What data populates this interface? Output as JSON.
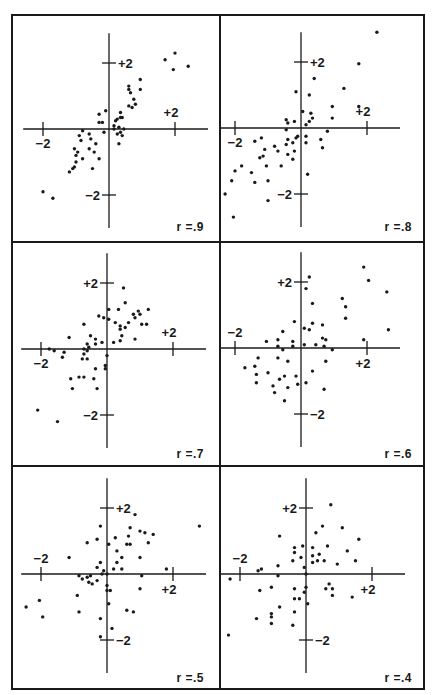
{
  "chart_data": [
    {
      "type": "scatter",
      "title": "r = .9",
      "label": "r =.9",
      "xlim": [
        -2.9,
        3.3
      ],
      "ylim": [
        -3.3,
        3.4
      ],
      "xticks": [
        -2,
        2
      ],
      "yticks": [
        -2,
        2
      ],
      "tick_labels": {
        "x_neg": "−2",
        "x_pos": "+2",
        "y_pos": "+2",
        "y_neg": "−2"
      },
      "points": [
        [
          -2.0,
          -1.9
        ],
        [
          -1.7,
          -2.1
        ],
        [
          -1.1,
          -1.2
        ],
        [
          -1.2,
          -1.3
        ],
        [
          -1.0,
          -1.0
        ],
        [
          -1.05,
          -1.15
        ],
        [
          -0.8,
          -0.9
        ],
        [
          -0.5,
          -1.2
        ],
        [
          -0.3,
          -0.9
        ],
        [
          -1.05,
          -0.6
        ],
        [
          -0.95,
          -0.7
        ],
        [
          -0.6,
          -0.6
        ],
        [
          -0.9,
          -0.2
        ],
        [
          -1.0,
          -0.8
        ],
        [
          -0.85,
          -0.35
        ],
        [
          -0.55,
          -0.3
        ],
        [
          -0.45,
          -0.7
        ],
        [
          -0.8,
          -0.05
        ],
        [
          -0.6,
          -0.15
        ],
        [
          -0.4,
          -0.45
        ],
        [
          -0.15,
          -0.1
        ],
        [
          -0.3,
          0.2
        ],
        [
          -0.2,
          0.2
        ],
        [
          -0.3,
          0.45
        ],
        [
          -0.1,
          0.55
        ],
        [
          0.15,
          0.1
        ],
        [
          0.2,
          0.25
        ],
        [
          0.25,
          0.3
        ],
        [
          0.35,
          0.35
        ],
        [
          0.4,
          0.35
        ],
        [
          0.35,
          0.5
        ],
        [
          0.15,
          0.0
        ],
        [
          0.3,
          0.05
        ],
        [
          0.35,
          -0.1
        ],
        [
          0.25,
          -0.15
        ],
        [
          0.4,
          -0.2
        ],
        [
          0.3,
          -0.45
        ],
        [
          0.45,
          0.0
        ],
        [
          0.6,
          0.7
        ],
        [
          0.7,
          0.65
        ],
        [
          0.8,
          0.75
        ],
        [
          0.65,
          1.1
        ],
        [
          0.75,
          0.9
        ],
        [
          0.6,
          1.2
        ],
        [
          0.6,
          1.3
        ],
        [
          0.95,
          1.2
        ],
        [
          0.95,
          1.5
        ],
        [
          1.7,
          2.1
        ],
        [
          2.0,
          2.3
        ],
        [
          1.95,
          1.8
        ],
        [
          2.4,
          1.9
        ]
      ]
    },
    {
      "type": "scatter",
      "title": "r = .8",
      "label": "r =.8",
      "xlim": [
        -2.9,
        3.3
      ],
      "ylim": [
        -3.3,
        3.4
      ],
      "xticks": [
        -2,
        2
      ],
      "yticks": [
        -2,
        2
      ],
      "tick_labels": {
        "x_neg": "−2",
        "x_pos": "+2",
        "y_pos": "+2",
        "y_neg": "−2"
      },
      "points": [
        [
          -2.3,
          -2.0
        ],
        [
          -2.05,
          -2.7
        ],
        [
          -2.1,
          -1.6
        ],
        [
          -2.0,
          -1.3
        ],
        [
          -1.8,
          -1.15
        ],
        [
          -1.5,
          -1.35
        ],
        [
          -1.4,
          -1.65
        ],
        [
          -1.4,
          -0.4
        ],
        [
          -1.2,
          -0.3
        ],
        [
          -1.25,
          -0.9
        ],
        [
          -1.15,
          -0.85
        ],
        [
          -1.1,
          -0.65
        ],
        [
          -1.05,
          -1.15
        ],
        [
          -1.0,
          -1.6
        ],
        [
          -1.0,
          -2.2
        ],
        [
          -0.8,
          -0.55
        ],
        [
          -0.7,
          -0.7
        ],
        [
          -0.6,
          -1.15
        ],
        [
          -0.45,
          -0.5
        ],
        [
          -0.4,
          -0.8
        ],
        [
          -0.4,
          -0.35
        ],
        [
          -0.45,
          0.25
        ],
        [
          -0.4,
          0.15
        ],
        [
          -0.45,
          -0.05
        ],
        [
          -0.25,
          -0.45
        ],
        [
          -0.25,
          -0.95
        ],
        [
          -0.2,
          -0.7
        ],
        [
          -0.2,
          0.2
        ],
        [
          -0.15,
          -0.3
        ],
        [
          -0.1,
          -0.25
        ],
        [
          -0.15,
          1.1
        ],
        [
          0.05,
          0.5
        ],
        [
          0.15,
          -0.25
        ],
        [
          0.15,
          -0.45
        ],
        [
          0.15,
          0.1
        ],
        [
          0.25,
          0.2
        ],
        [
          0.3,
          0.45
        ],
        [
          0.35,
          0.3
        ],
        [
          0.25,
          1.0
        ],
        [
          0.4,
          1.5
        ],
        [
          0.2,
          -1.4
        ],
        [
          0.6,
          -0.35
        ],
        [
          0.65,
          -0.6
        ],
        [
          0.8,
          -0.1
        ],
        [
          0.95,
          0.3
        ],
        [
          0.95,
          0.65
        ],
        [
          1.3,
          1.2
        ],
        [
          1.75,
          1.95
        ],
        [
          1.75,
          0.65
        ],
        [
          2.3,
          2.9
        ]
      ]
    },
    {
      "type": "scatter",
      "title": "r = .7",
      "label": "r =.7",
      "xlim": [
        -2.9,
        3.3
      ],
      "ylim": [
        -3.3,
        3.4
      ],
      "xticks": [
        -2,
        2
      ],
      "yticks": [
        -2,
        2
      ],
      "tick_labels": {
        "x_neg": "−2",
        "x_pos": "+2",
        "y_pos": "+2",
        "y_neg": "−2"
      },
      "points": [
        [
          -2.1,
          -1.85
        ],
        [
          -1.5,
          -2.2
        ],
        [
          -1.05,
          -1.2
        ],
        [
          -1.1,
          -0.9
        ],
        [
          -0.85,
          -0.85
        ],
        [
          -0.7,
          -0.85
        ],
        [
          -0.4,
          -0.9
        ],
        [
          -0.3,
          -1.2
        ],
        [
          -0.35,
          -0.6
        ],
        [
          -0.05,
          -0.5
        ],
        [
          -0.05,
          -0.6
        ],
        [
          0.0,
          -0.2
        ],
        [
          -0.6,
          -0.3
        ],
        [
          -0.75,
          -0.3
        ],
        [
          -0.7,
          -0.15
        ],
        [
          -0.6,
          -0.05
        ],
        [
          -0.55,
          0.05
        ],
        [
          -0.6,
          0.15
        ],
        [
          -0.7,
          0.0
        ],
        [
          -1.6,
          -0.05
        ],
        [
          -1.75,
          0.0
        ],
        [
          -1.35,
          -0.25
        ],
        [
          -1.3,
          -0.1
        ],
        [
          -1.15,
          0.35
        ],
        [
          -0.5,
          0.4
        ],
        [
          -0.35,
          0.3
        ],
        [
          -0.35,
          0.15
        ],
        [
          -0.15,
          0.2
        ],
        [
          0.2,
          0.2
        ],
        [
          -0.7,
          0.75
        ],
        [
          -0.25,
          1.0
        ],
        [
          -0.1,
          0.95
        ],
        [
          0.05,
          0.9
        ],
        [
          0.05,
          1.2
        ],
        [
          0.25,
          0.8
        ],
        [
          0.4,
          0.6
        ],
        [
          0.4,
          0.7
        ],
        [
          0.4,
          0.25
        ],
        [
          0.45,
          0.4
        ],
        [
          0.55,
          0.65
        ],
        [
          0.65,
          0.8
        ],
        [
          0.35,
          1.2
        ],
        [
          0.55,
          1.4
        ],
        [
          0.5,
          1.85
        ],
        [
          0.85,
          0.3
        ],
        [
          0.8,
          1.05
        ],
        [
          0.85,
          0.95
        ],
        [
          0.95,
          1.15
        ],
        [
          1.05,
          0.75
        ],
        [
          1.0,
          1.05
        ],
        [
          1.2,
          0.75
        ],
        [
          1.25,
          1.2
        ]
      ]
    },
    {
      "type": "scatter",
      "title": "r = .6",
      "label": "r =.6",
      "xlim": [
        -2.9,
        3.3
      ],
      "ylim": [
        -3.3,
        3.4
      ],
      "xticks": [
        -2,
        2
      ],
      "yticks": [
        -2,
        2
      ],
      "tick_labels": {
        "x_neg": "−2",
        "x_pos": "+2",
        "y_pos": "+2",
        "y_neg": "−2"
      },
      "points": [
        [
          -1.7,
          -0.6
        ],
        [
          -1.4,
          -0.55
        ],
        [
          -1.35,
          -0.8
        ],
        [
          -1.35,
          -1.05
        ],
        [
          -1.3,
          -0.3
        ],
        [
          -1.0,
          -0.75
        ],
        [
          -0.85,
          -1.15
        ],
        [
          -0.8,
          -1.35
        ],
        [
          -0.7,
          -0.3
        ],
        [
          -0.65,
          -0.95
        ],
        [
          -0.5,
          -0.85
        ],
        [
          -0.5,
          -1.6
        ],
        [
          -0.4,
          -1.2
        ],
        [
          -0.4,
          -0.4
        ],
        [
          -0.55,
          -0.05
        ],
        [
          -0.7,
          0.05
        ],
        [
          -0.7,
          0.25
        ],
        [
          -0.55,
          0.5
        ],
        [
          -1.05,
          0.2
        ],
        [
          -0.25,
          0.2
        ],
        [
          -0.25,
          0.05
        ],
        [
          -0.2,
          0.8
        ],
        [
          -0.15,
          -0.85
        ],
        [
          -0.1,
          -1.1
        ],
        [
          0.1,
          0.6
        ],
        [
          0.1,
          0.1
        ],
        [
          0.25,
          0.55
        ],
        [
          0.15,
          1.8
        ],
        [
          0.25,
          2.15
        ],
        [
          0.35,
          1.35
        ],
        [
          0.35,
          0.75
        ],
        [
          0.35,
          -0.7
        ],
        [
          0.45,
          0.1
        ],
        [
          0.15,
          -1.05
        ],
        [
          0.65,
          0.7
        ],
        [
          0.65,
          0.3
        ],
        [
          0.7,
          0.05
        ],
        [
          0.75,
          0.25
        ],
        [
          0.75,
          -0.4
        ],
        [
          0.7,
          -1.25
        ],
        [
          0.95,
          -0.05
        ],
        [
          1.25,
          1.5
        ],
        [
          1.35,
          1.25
        ],
        [
          1.35,
          0.9
        ],
        [
          1.9,
          0.25
        ],
        [
          1.9,
          2.45
        ],
        [
          2.05,
          2.05
        ],
        [
          2.6,
          1.7
        ],
        [
          2.65,
          0.55
        ]
      ]
    },
    {
      "type": "scatter",
      "title": "r = .5",
      "label": "r =.5",
      "xlim": [
        -2.9,
        3.3
      ],
      "ylim": [
        -3.3,
        3.4
      ],
      "xticks": [
        -2,
        2
      ],
      "yticks": [
        -2,
        2
      ],
      "tick_labels": {
        "x_neg": "−2",
        "x_pos": "+2",
        "y_pos": "+2",
        "y_neg": "−2"
      },
      "points": [
        [
          -2.45,
          -1.0
        ],
        [
          -2.05,
          -0.8
        ],
        [
          -1.95,
          -1.3
        ],
        [
          -1.15,
          0.5
        ],
        [
          -0.9,
          -0.65
        ],
        [
          -0.85,
          -1.15
        ],
        [
          -0.85,
          -0.05
        ],
        [
          -0.75,
          -0.15
        ],
        [
          -0.6,
          -0.1
        ],
        [
          -0.55,
          -0.25
        ],
        [
          -0.5,
          -0.05
        ],
        [
          -0.45,
          -0.3
        ],
        [
          -0.3,
          -0.2
        ],
        [
          -0.3,
          0.2
        ],
        [
          -0.2,
          0.35
        ],
        [
          -0.2,
          -1.35
        ],
        [
          -0.2,
          -1.9
        ],
        [
          -0.3,
          1.05
        ],
        [
          -0.2,
          1.45
        ],
        [
          -0.6,
          0.95
        ],
        [
          -0.1,
          0.1
        ],
        [
          -0.15,
          0.0
        ],
        [
          0.0,
          0.0
        ],
        [
          0.0,
          -0.35
        ],
        [
          0.0,
          -0.5
        ],
        [
          0.05,
          -0.9
        ],
        [
          0.1,
          -0.5
        ],
        [
          0.05,
          0.9
        ],
        [
          0.15,
          -1.65
        ],
        [
          0.2,
          0.15
        ],
        [
          0.25,
          1.1
        ],
        [
          0.3,
          0.7
        ],
        [
          0.3,
          0.35
        ],
        [
          0.45,
          0.15
        ],
        [
          0.45,
          0.5
        ],
        [
          0.6,
          0.9
        ],
        [
          0.65,
          1.15
        ],
        [
          0.7,
          0.9
        ],
        [
          0.7,
          1.4
        ],
        [
          0.6,
          -1.1
        ],
        [
          0.8,
          -1.15
        ],
        [
          0.85,
          1.8
        ],
        [
          1.0,
          0.5
        ],
        [
          1.0,
          -0.45
        ],
        [
          1.0,
          1.3
        ],
        [
          1.05,
          -0.05
        ],
        [
          1.15,
          1.25
        ],
        [
          1.25,
          0.95
        ],
        [
          1.4,
          1.2
        ],
        [
          1.8,
          0.15
        ],
        [
          2.8,
          1.45
        ]
      ]
    },
    {
      "type": "scatter",
      "title": "r = .4",
      "label": "r =.4",
      "xlim": [
        -2.9,
        3.3
      ],
      "ylim": [
        -3.3,
        3.4
      ],
      "xticks": [
        -2,
        2
      ],
      "yticks": [
        -2,
        2
      ],
      "tick_labels": {
        "x_neg": "−2",
        "x_pos": "+2",
        "y_pos": "+2",
        "y_neg": "−2"
      },
      "points": [
        [
          -2.3,
          -0.15
        ],
        [
          -2.35,
          -1.85
        ],
        [
          -1.45,
          0.1
        ],
        [
          -1.35,
          0.15
        ],
        [
          -1.4,
          -0.5
        ],
        [
          -1.5,
          -1.35
        ],
        [
          -1.05,
          -0.4
        ],
        [
          -1.05,
          -1.5
        ],
        [
          -1.05,
          -1.3
        ],
        [
          -1.05,
          -1.2
        ],
        [
          -0.85,
          -0.05
        ],
        [
          -0.85,
          0.25
        ],
        [
          -0.8,
          -1.0
        ],
        [
          -0.8,
          1.15
        ],
        [
          -0.4,
          0.4
        ],
        [
          -0.35,
          0.65
        ],
        [
          -0.35,
          0.8
        ],
        [
          -0.35,
          -0.45
        ],
        [
          -0.35,
          -0.75
        ],
        [
          -0.35,
          -1.15
        ],
        [
          -0.4,
          -1.55
        ],
        [
          -0.2,
          -0.75
        ],
        [
          -0.15,
          0.5
        ],
        [
          -0.1,
          0.85
        ],
        [
          -0.05,
          0.2
        ],
        [
          0.0,
          0.0
        ],
        [
          0.0,
          -0.4
        ],
        [
          -0.05,
          -0.55
        ],
        [
          0.05,
          -0.9
        ],
        [
          0.2,
          0.35
        ],
        [
          0.2,
          0.55
        ],
        [
          0.2,
          0.8
        ],
        [
          0.3,
          1.25
        ],
        [
          0.35,
          0.4
        ],
        [
          0.4,
          0.6
        ],
        [
          0.5,
          1.45
        ],
        [
          0.55,
          0.4
        ],
        [
          0.6,
          -0.45
        ],
        [
          0.65,
          0.85
        ],
        [
          0.7,
          -0.3
        ],
        [
          0.75,
          2.1
        ],
        [
          0.8,
          -0.45
        ],
        [
          0.8,
          -0.65
        ],
        [
          0.95,
          0.3
        ],
        [
          1.1,
          1.4
        ],
        [
          1.25,
          0.7
        ],
        [
          1.4,
          -0.7
        ],
        [
          1.5,
          0.4
        ],
        [
          1.6,
          1.05
        ]
      ]
    }
  ]
}
